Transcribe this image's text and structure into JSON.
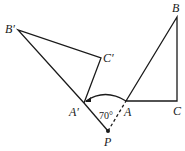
{
  "diagram": {
    "type": "geometry-rotation",
    "points": {
      "B_prime": {
        "label": "B′",
        "x": 18,
        "y": 30
      },
      "C_prime": {
        "label": "C′",
        "x": 101,
        "y": 58
      },
      "A_prime": {
        "label": "A′",
        "x": 84,
        "y": 103
      },
      "P": {
        "label": "P",
        "x": 108,
        "y": 131
      },
      "A": {
        "label": "A",
        "x": 126,
        "y": 101
      },
      "B": {
        "label": "B",
        "x": 177,
        "y": 17
      },
      "C": {
        "label": "C",
        "x": 177,
        "y": 101
      }
    },
    "angle_label": "70°",
    "line_color": "#1a1a1a"
  }
}
